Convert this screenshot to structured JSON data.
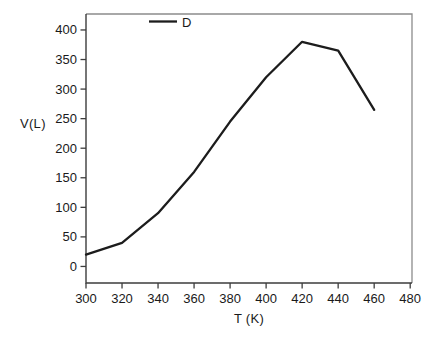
{
  "page": {
    "background": "#ffffff"
  },
  "chart_data": {
    "type": "line",
    "title": "",
    "xlabel": "T (K)",
    "ylabel": "V(L)",
    "legend": [
      {
        "label": "D",
        "color": "#1c1c1c"
      }
    ],
    "legend_position": "top-center-inside",
    "x": [
      300,
      320,
      340,
      360,
      380,
      400,
      420,
      440,
      460
    ],
    "series": [
      {
        "name": "D",
        "color": "#1c1c1c",
        "values": [
          20,
          40,
          90,
          160,
          245,
          320,
          380,
          365,
          265
        ]
      }
    ],
    "x_ticks": [
      300,
      320,
      340,
      360,
      380,
      400,
      420,
      440,
      460,
      480
    ],
    "y_ticks": [
      0,
      50,
      100,
      150,
      200,
      250,
      300,
      350,
      400
    ],
    "xlim": [
      300,
      481
    ],
    "ylim": [
      -28,
      427
    ],
    "grid": false,
    "axis_color": "#3d3d3d",
    "box_color": "#8c8c8c",
    "text_color": "#1a1a1a"
  }
}
